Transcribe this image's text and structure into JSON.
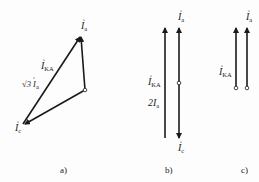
{
  "diagram": {
    "type": "phasor-diagrams",
    "colors": {
      "line": "#1a1a1a",
      "text": "#222222",
      "background": "#fdfdfd"
    },
    "panels": [
      {
        "caption": "a)",
        "labels": {
          "ia": "I",
          "ia_sub": "a",
          "ika": "I",
          "ika_sub": "KA",
          "sqrt3": "√3 I",
          "sqrt3_sub": "a",
          "ic": "I",
          "ic_sub": "c"
        }
      },
      {
        "caption": "b)",
        "labels": {
          "ia": "I",
          "ia_sub": "a",
          "ika": "I",
          "ika_sub": "KA",
          "two": "2I",
          "two_sub": "a",
          "ic": "I",
          "ic_sub": "c"
        }
      },
      {
        "caption": "c)",
        "labels": {
          "ia": "I",
          "ia_sub": "a",
          "ika": "I",
          "ika_sub": "KA"
        }
      }
    ]
  }
}
